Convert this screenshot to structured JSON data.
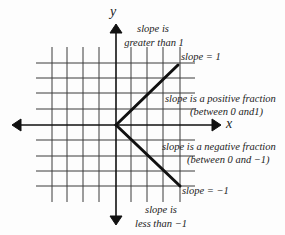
{
  "diagram": {
    "axes": {
      "x_label": "x",
      "y_label": "y"
    },
    "labels": {
      "top_line1": "slope is",
      "top_line2": "greater than 1",
      "slope_pos_one": "slope = 1",
      "pos_fraction_line1": "slope is a positive fraction",
      "pos_fraction_line2": "(between 0 and1)",
      "neg_fraction_line1": "slope is a negative fraction",
      "neg_fraction_line2": "(between 0 and −1)",
      "slope_neg_one": "slope = −1",
      "bottom_line1": "slope is",
      "bottom_line2": "less than −1"
    },
    "colors": {
      "grid": "#3a3a3a",
      "axis": "#111111",
      "thick_line": "#111111",
      "background": "#fdfdfd"
    }
  }
}
